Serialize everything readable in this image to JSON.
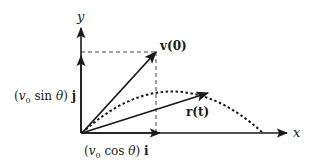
{
  "diagram": {
    "title": "",
    "colors": {
      "ink": "#1a1a1a",
      "background": "#ffffff"
    },
    "axes": {
      "x_label": "x",
      "y_label": "y"
    },
    "vectors": {
      "initial_velocity_label": "v(0)",
      "position_label": "r(t)"
    },
    "components": {
      "vertical_label": "(v₀ sin θ) j",
      "vertical_prefix": "(",
      "vertical_v": "v",
      "vertical_sub": "0",
      "vertical_mid": " sin ",
      "vertical_theta": "θ",
      "vertical_close": ") ",
      "vertical_unit": "j",
      "horizontal_label": "(v₀ cos θ) i",
      "horizontal_prefix": "(",
      "horizontal_v": "v",
      "horizontal_sub": "0",
      "horizontal_mid": " cos ",
      "horizontal_theta": "θ",
      "horizontal_close": ") ",
      "horizontal_unit": "i"
    },
    "trajectory": {
      "style": "dashed parabola",
      "description": "projectile path"
    }
  }
}
